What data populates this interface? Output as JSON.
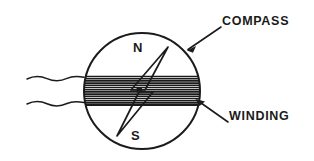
{
  "figure": {
    "name": "compass-with-winding-diagram",
    "type": "technical-line-drawing",
    "background_color": "#ffffff",
    "ink_color": "#1b1b1b"
  },
  "callouts": {
    "compass": {
      "label": "COMPASS",
      "leader_from": [
        188,
        49
      ],
      "leader_to": [
        221,
        27
      ]
    },
    "winding": {
      "label": "WINDING",
      "leader_from": [
        228,
        122
      ],
      "leader_to": [
        196,
        100
      ]
    }
  },
  "compass": {
    "center": [
      142,
      91
    ],
    "radius": 58,
    "pivot_dot": [
      139,
      90
    ],
    "poles": {
      "north": "N",
      "south": "S"
    },
    "needle": {
      "north_tip": [
        168,
        48
      ],
      "south_tip": [
        117,
        136
      ]
    }
  },
  "winding_band": {
    "top": 76,
    "bottom": 105,
    "hatch_line_count": 13
  },
  "lead_wires": {
    "count": 2,
    "upper_y": 78,
    "lower_y": 103,
    "extends_to_x": 27,
    "style": "wavy"
  }
}
